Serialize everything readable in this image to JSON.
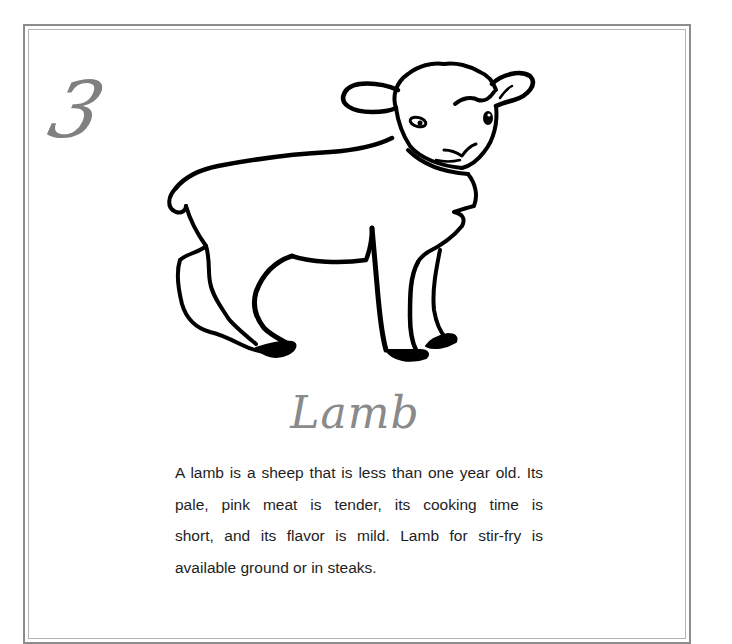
{
  "page": {
    "chapter_number": "3",
    "title": "Lamb",
    "illustration": {
      "subject": "lamb-line-drawing",
      "alt": "Line drawing of a standing lamb"
    },
    "body": {
      "text": "A lamb is a sheep that is less than one year old. Its pale, pink meat is tender, its cooking time is short, and its flavor is mild. Lamb for stir-fry is available ground or in steaks.",
      "lines": [
        "A lamb is a sheep that is less than one year old. Its",
        "pale, pink meat is tender, its cooking time is",
        "short, and its flavor is mild. Lamb for stir-fry is",
        "available ground or in steaks."
      ]
    }
  },
  "colors": {
    "frame_outer": "#8c8c8c",
    "frame_inner": "#b4b4b4",
    "chapter_number": "#808080",
    "title": "#8a8a8a",
    "body_text": "#1e1e1e",
    "illustration_ink": "#000000"
  }
}
